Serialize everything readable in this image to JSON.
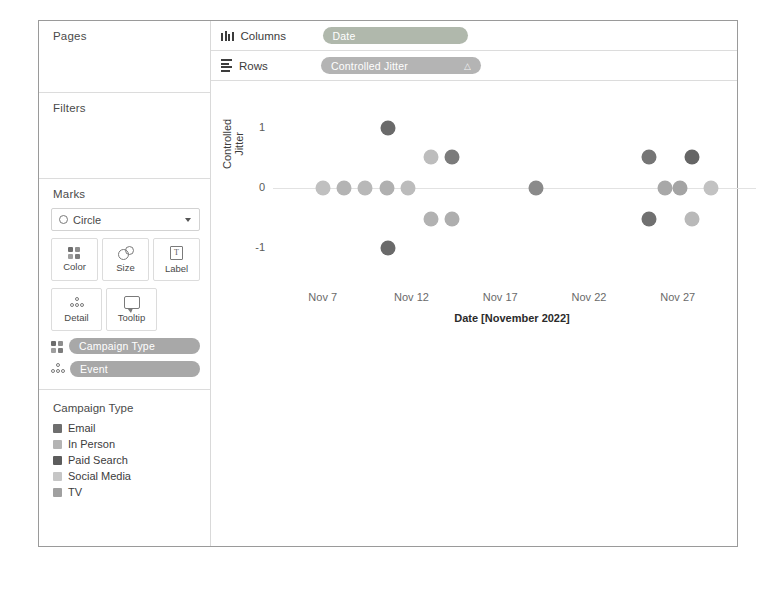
{
  "app": {
    "title": "Tableau Worksheet"
  },
  "sidebar": {
    "pages": {
      "title": "Pages"
    },
    "filters": {
      "title": "Filters"
    },
    "marks": {
      "title": "Marks",
      "mark_type": "Circle",
      "mark_type_icon": "circle-icon",
      "dropdown_icon": "chevron-down-icon",
      "buttons": [
        {
          "label": "Color",
          "icon": "color-icon"
        },
        {
          "label": "Size",
          "icon": "size-icon"
        },
        {
          "label": "Label",
          "icon": "label-icon"
        },
        {
          "label": "Detail",
          "icon": "detail-icon"
        },
        {
          "label": "Tooltip",
          "icon": "tooltip-icon"
        }
      ],
      "pills": [
        {
          "label": "Campaign Type",
          "icon": "color-icon",
          "color": "#a8a8a8"
        },
        {
          "label": "Event",
          "icon": "detail-icon",
          "color": "#a8a8a8"
        }
      ]
    },
    "legend": {
      "title": "Campaign Type",
      "items": [
        {
          "label": "Email",
          "color": "#6e6e6e"
        },
        {
          "label": "In Person",
          "color": "#b4b4b4"
        },
        {
          "label": "Paid Search",
          "color": "#5c5c5c"
        },
        {
          "label": "Social Media",
          "color": "#c6c6c6"
        },
        {
          "label": "TV",
          "color": "#a0a0a0"
        }
      ]
    }
  },
  "shelves": {
    "columns": {
      "label": "Columns",
      "icon": "columns-icon",
      "pill": {
        "label": "Date",
        "color": "#b0b8ac"
      }
    },
    "rows": {
      "label": "Rows",
      "icon": "rows-icon",
      "pill": {
        "label": "Controlled Jitter",
        "suffix": "△",
        "color": "#b4b4b4"
      }
    }
  },
  "chart_data": {
    "type": "scatter",
    "title": "",
    "xlabel": "Date [November 2022]",
    "ylabel": "Controlled\nJitter",
    "xtick_labels": [
      "Nov 7",
      "Nov 12",
      "Nov 17",
      "Nov 22",
      "Nov 27"
    ],
    "xtick_values": [
      7,
      12,
      17,
      22,
      27
    ],
    "ytick_labels": [
      "1",
      "0",
      "-1"
    ],
    "ytick_values": [
      1,
      0,
      -1
    ],
    "xlim": [
      4.2,
      30.0
    ],
    "ylim": [
      -1.55,
      1.55
    ],
    "grid": false,
    "legend_position": "sidebar",
    "color_field": "Campaign Type",
    "detail_field": "Event",
    "series": [
      {
        "name": "Email",
        "color": "#6e6e6e"
      },
      {
        "name": "In Person",
        "color": "#b4b4b4"
      },
      {
        "name": "Paid Search",
        "color": "#5c5c5c"
      },
      {
        "name": "Social Media",
        "color": "#c6c6c6"
      },
      {
        "name": "TV",
        "color": "#a0a0a0"
      }
    ],
    "points": [
      {
        "x": 7.0,
        "y": 0.0,
        "campaign_type": "Social Media",
        "color": "#c0c0c0"
      },
      {
        "x": 8.2,
        "y": 0.0,
        "campaign_type": "TV",
        "color": "#b4b4b4"
      },
      {
        "x": 9.4,
        "y": 0.0,
        "campaign_type": "In Person",
        "color": "#b8b8b8"
      },
      {
        "x": 10.6,
        "y": 0.0,
        "campaign_type": "TV",
        "color": "#b0b0b0"
      },
      {
        "x": 11.8,
        "y": 0.0,
        "campaign_type": "Social Media",
        "color": "#bcbcbc"
      },
      {
        "x": 10.7,
        "y": 1.0,
        "campaign_type": "Paid Search",
        "color": "#6a6a6a"
      },
      {
        "x": 10.7,
        "y": -1.0,
        "campaign_type": "Paid Search",
        "color": "#6a6a6a"
      },
      {
        "x": 13.1,
        "y": 0.52,
        "campaign_type": "Social Media",
        "color": "#bdbdbd"
      },
      {
        "x": 14.3,
        "y": 0.52,
        "campaign_type": "Email",
        "color": "#7b7b7b"
      },
      {
        "x": 13.1,
        "y": -0.52,
        "campaign_type": "In Person",
        "color": "#b2b2b2"
      },
      {
        "x": 14.3,
        "y": -0.52,
        "campaign_type": "TV",
        "color": "#aeaeae"
      },
      {
        "x": 19.0,
        "y": 0.0,
        "campaign_type": "Email",
        "color": "#8a8a8a"
      },
      {
        "x": 25.4,
        "y": 0.52,
        "campaign_type": "Email",
        "color": "#757575"
      },
      {
        "x": 27.8,
        "y": 0.52,
        "campaign_type": "Paid Search",
        "color": "#656565"
      },
      {
        "x": 26.3,
        "y": 0.0,
        "campaign_type": "TV",
        "color": "#a8a8a8"
      },
      {
        "x": 27.1,
        "y": 0.0,
        "campaign_type": "In Person",
        "color": "#a4a4a4"
      },
      {
        "x": 28.9,
        "y": 0.0,
        "campaign_type": "Social Media",
        "color": "#c2c2c2"
      },
      {
        "x": 25.4,
        "y": -0.52,
        "campaign_type": "Email",
        "color": "#707070"
      },
      {
        "x": 27.8,
        "y": -0.52,
        "campaign_type": "Social Media",
        "color": "#b9b9b9"
      }
    ]
  }
}
